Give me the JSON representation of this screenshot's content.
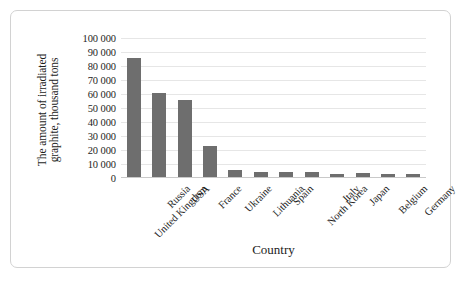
{
  "chart_data": {
    "type": "bar",
    "title": "",
    "subtitle": "",
    "xlabel": "Country",
    "ylabel": "The amount of irradiated graphite, thousand tons",
    "ylabel_lines": [
      "The amount of irradiated",
      "graphite, thousand tons"
    ],
    "categories": [
      "United Kingdom",
      "Russia",
      "USA",
      "France",
      "Ukraine",
      "Lithuania",
      "Spain",
      "North Korea",
      "Italy",
      "Japan",
      "Belgium",
      "Germany"
    ],
    "values": [
      86000,
      60500,
      55500,
      23000,
      6000,
      4000,
      4000,
      4200,
      3200,
      3400,
      3000,
      2800
    ],
    "ylim": [
      0,
      100000
    ],
    "ytick_values": [
      0,
      10000,
      20000,
      30000,
      40000,
      50000,
      60000,
      70000,
      80000,
      90000,
      100000
    ],
    "ytick_labels": [
      "0",
      "10 000",
      "20 000",
      "30 000",
      "40 000",
      "50 000",
      "60 000",
      "70 000",
      "80 000",
      "90 000",
      "100 000"
    ],
    "grid": true,
    "grid_axis": "y",
    "legend": false,
    "legend_position": "none",
    "bar_color": "#6e6e6e",
    "grid_color": "#e6e6e6",
    "axis_color": "#c9c9c9",
    "background_color": "#ffffff",
    "text_color": "#1d1d1d",
    "frame_border_color": "#d2d2d2",
    "xtick_label_rotation": -45
  }
}
